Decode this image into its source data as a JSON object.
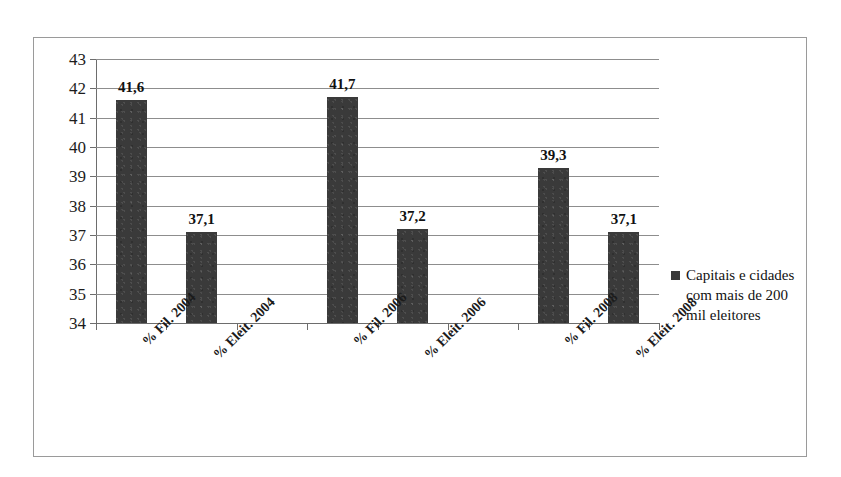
{
  "chart_data": {
    "type": "bar",
    "title": "",
    "xlabel": "",
    "ylabel": "",
    "ylim": [
      34,
      43
    ],
    "grid": true,
    "legend_position": "right",
    "categories": [
      "% Fil. 2004",
      "% Eleit. 2004",
      "% Fil. 2006",
      "% Eleit. 2006",
      "% Fil. 2008",
      "% Eleit. 2008"
    ],
    "values": [
      41.6,
      37.1,
      41.7,
      37.2,
      39.3,
      37.1
    ],
    "value_labels": [
      "41,6",
      "37,1",
      "41,7",
      "37,2",
      "39,3",
      "37,1"
    ],
    "series": [
      {
        "name": "Capitais e cidades com mais de 200 mil eleitores",
        "values": [
          41.6,
          37.1,
          41.7,
          37.2,
          39.3,
          37.1
        ],
        "color": "#3a3a3a"
      }
    ],
    "y_ticks": [
      34,
      35,
      36,
      37,
      38,
      39,
      40,
      41,
      42,
      43
    ],
    "y_tick_labels": [
      "34",
      "35",
      "36",
      "37",
      "38",
      "39",
      "40",
      "41",
      "42",
      "43"
    ]
  },
  "legend": {
    "marker": "legend-swatch",
    "line1": "Capitais e cidades",
    "line2": "com mais de 200",
    "line3": "mil eleitores",
    "full_text": "Capitais e cidades com mais de 200 mil eleitores"
  },
  "colors": {
    "bar": "#3a3a3a",
    "gridline": "#8d8d8d",
    "axis": "#6d6d6d",
    "frame": "#9a9a9a",
    "background": "#ffffff",
    "text": "#111111"
  }
}
